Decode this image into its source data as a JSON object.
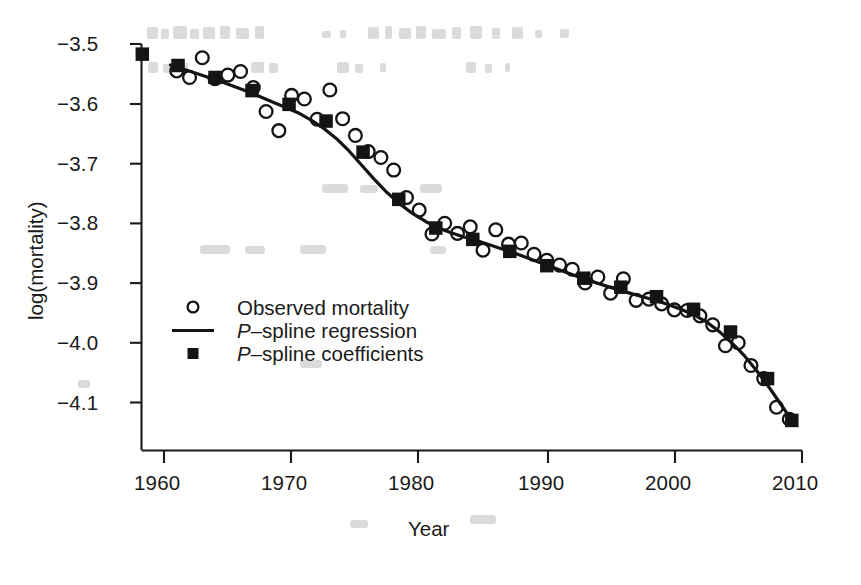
{
  "chart_data": {
    "type": "scatter",
    "title": "",
    "xlabel": "Year",
    "ylabel": "log(mortality)",
    "xlim": [
      1958,
      2010
    ],
    "ylim": [
      -4.155,
      -3.47
    ],
    "grid": false,
    "xticks": [
      1960,
      1970,
      1980,
      1990,
      2000,
      2010
    ],
    "xtick_labels": [
      "1960",
      "1970",
      "1980",
      "1990",
      "2000",
      "2010"
    ],
    "yticks": [
      -3.5,
      -3.6,
      -3.7,
      -3.8,
      -3.9,
      -4.0,
      -4.1
    ],
    "ytick_labels": [
      "−3.5",
      "−3.6",
      "−3.7",
      "−3.8",
      "−3.9",
      "−4.0",
      "−4.1"
    ],
    "legend": {
      "position": "center-left",
      "entries": [
        {
          "marker": "open-circle",
          "label": "Observed mortality",
          "italic_prefix": ""
        },
        {
          "marker": "line",
          "label": "–spline regression",
          "italic_prefix": "P"
        },
        {
          "marker": "filled-square",
          "label": "–spline coefficients",
          "italic_prefix": "P"
        }
      ]
    },
    "series": [
      {
        "name": "Observed mortality",
        "marker": "open-circle",
        "color": "#111111",
        "x": [
          1961,
          1962,
          1963,
          1964,
          1965,
          1966,
          1967,
          1968,
          1969,
          1970,
          1971,
          1972,
          1973,
          1974,
          1975,
          1976,
          1977,
          1978,
          1979,
          1980,
          1981,
          1982,
          1983,
          1984,
          1985,
          1986,
          1987,
          1988,
          1989,
          1990,
          1991,
          1992,
          1993,
          1994,
          1995,
          1996,
          1997,
          1998,
          1999,
          2000,
          2001,
          2002,
          2003,
          2004,
          2005,
          2006,
          2007,
          2008,
          2009
        ],
        "y": [
          -3.545,
          -3.556,
          -3.523,
          -3.558,
          -3.552,
          -3.546,
          -3.573,
          -3.613,
          -3.645,
          -3.586,
          -3.592,
          -3.626,
          -3.577,
          -3.625,
          -3.653,
          -3.68,
          -3.69,
          -3.711,
          -3.757,
          -3.778,
          -3.818,
          -3.8,
          -3.817,
          -3.806,
          -3.845,
          -3.811,
          -3.835,
          -3.833,
          -3.852,
          -3.862,
          -3.87,
          -3.877,
          -3.9,
          -3.89,
          -3.917,
          -3.893,
          -3.929,
          -3.927,
          -3.935,
          -3.945,
          -3.946,
          -3.955,
          -3.97,
          -4.005,
          -4.0,
          -4.038,
          -4.06,
          -4.108,
          -4.128
        ]
      },
      {
        "name": "P-spline coefficients",
        "marker": "filled-square",
        "color": "#111111",
        "x": [
          1958.3,
          1961.1,
          1964.0,
          1966.9,
          1969.8,
          1972.7,
          1975.6,
          1978.4,
          1981.3,
          1984.2,
          1987.1,
          1990.0,
          1992.9,
          1995.8,
          1998.6,
          2001.5,
          2004.4,
          2007.3,
          2009.2
        ],
        "y": [
          -3.517,
          -3.536,
          -3.556,
          -3.578,
          -3.601,
          -3.629,
          -3.681,
          -3.76,
          -3.808,
          -3.827,
          -3.847,
          -3.871,
          -3.892,
          -3.907,
          -3.923,
          -3.944,
          -3.982,
          -4.06,
          -4.13
        ]
      }
    ],
    "fit_curve": {
      "name": "P-spline regression",
      "color": "#111111",
      "x": [
        1960.5,
        1961.5,
        1962.5,
        1963.5,
        1964.5,
        1965.5,
        1966.5,
        1967.5,
        1968.5,
        1969.5,
        1970.5,
        1971.5,
        1972.5,
        1973.5,
        1974.5,
        1975.5,
        1976.5,
        1977.5,
        1978.5,
        1979.5,
        1980.5,
        1981.5,
        1982.5,
        1983.5,
        1984.5,
        1985.5,
        1986.5,
        1987.5,
        1988.5,
        1989.5,
        1990.5,
        1991.5,
        1992.5,
        1993.5,
        1994.5,
        1995.5,
        1996.5,
        1997.5,
        1998.5,
        1999.5,
        2000.5,
        2001.5,
        2002.5,
        2003.5,
        2004.5,
        2005.5,
        2006.5,
        2007.5,
        2008.5,
        2009.2
      ],
      "y": [
        -3.535,
        -3.542,
        -3.549,
        -3.556,
        -3.563,
        -3.571,
        -3.579,
        -3.588,
        -3.597,
        -3.606,
        -3.615,
        -3.627,
        -3.641,
        -3.658,
        -3.679,
        -3.703,
        -3.727,
        -3.749,
        -3.768,
        -3.784,
        -3.797,
        -3.808,
        -3.816,
        -3.823,
        -3.829,
        -3.836,
        -3.843,
        -3.85,
        -3.858,
        -3.866,
        -3.874,
        -3.882,
        -3.89,
        -3.897,
        -3.904,
        -3.911,
        -3.917,
        -3.923,
        -3.929,
        -3.936,
        -3.944,
        -3.953,
        -3.965,
        -3.981,
        -4.0,
        -4.022,
        -4.048,
        -4.077,
        -4.108,
        -4.13
      ]
    }
  },
  "figure": {
    "background": "#ffffff",
    "ink": "#111111",
    "axis_color": "#1a1a1a",
    "ghost_note": "faint scan bleed-through marks at top of figure"
  }
}
